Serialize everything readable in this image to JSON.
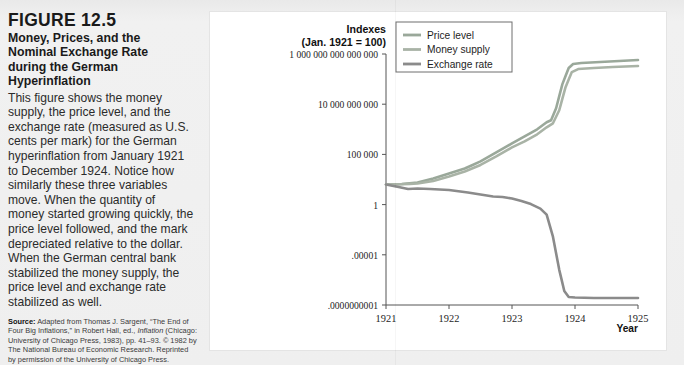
{
  "figure": {
    "number": "FIGURE 12.5",
    "title": "Money, Prices, and the Nominal Exchange Rate during the German Hyperinflation",
    "description": "This figure shows the money supply, the price level, and the exchange rate (measured as U.S. cents per mark) for the German hyperinflation from January 1921 to December 1924. Notice how similarly these three variables move. When the quantity of money started growing quickly, the price level followed, and the mark depreciated relative to the dollar. When the German central bank stabilized the money supply, the price level and exchange rate stabilized as well.",
    "source_label": "Source:",
    "source_text_1": "Adapted from Thomas J. Sargent, “The End of Four Big Inflations,” in Robert Hall, ed.,",
    "source_italic": "Inflation",
    "source_text_2": "(Chicago: University of Chicago Press, 1983), pp. 41–93. © 1982 by The National Bureau of Economic Research. Reprinted by permission of the University of Chicago Press."
  },
  "chart_data": {
    "type": "line",
    "title": "",
    "ylabel_line1": "Indexes",
    "ylabel_line2": "(Jan. 1921 = 100)",
    "xlabel": "Year",
    "ytick_labels": [
      "1 000 000 000 000 000",
      "10 000 000 000",
      "100 000",
      "1",
      ".00001",
      ".0000000001"
    ],
    "ytick_values": [
      1000000000000000.0,
      10000000000.0,
      100000.0,
      1,
      1e-05,
      1e-10
    ],
    "xtick_labels": [
      "1921",
      "1922",
      "1923",
      "1924",
      "1925"
    ],
    "xtick_values": [
      1921,
      1922,
      1923,
      1924,
      1925
    ],
    "xlim": [
      1921,
      1925
    ],
    "ylim_log10": [
      -10,
      15
    ],
    "grid": false,
    "legend_position": "top-right",
    "legend": [
      {
        "name": "Price level",
        "color": "#9aa89a"
      },
      {
        "name": "Money supply",
        "color": "#a9b3a6"
      },
      {
        "name": "Exchange rate",
        "color": "#8b8b8b"
      }
    ],
    "series": [
      {
        "name": "Price level",
        "color": "#9aa89a",
        "points": [
          [
            1921.0,
            2.0
          ],
          [
            1921.25,
            2.05
          ],
          [
            1921.5,
            2.2
          ],
          [
            1921.75,
            2.6
          ],
          [
            1922.0,
            3.1
          ],
          [
            1922.25,
            3.6
          ],
          [
            1922.5,
            4.3
          ],
          [
            1922.75,
            5.2
          ],
          [
            1923.0,
            6.1
          ],
          [
            1923.2,
            6.8
          ],
          [
            1923.4,
            7.5
          ],
          [
            1923.55,
            8.2
          ],
          [
            1923.62,
            8.4
          ],
          [
            1923.7,
            9.6
          ],
          [
            1923.8,
            12.0
          ],
          [
            1923.9,
            13.6
          ],
          [
            1923.97,
            14.0
          ],
          [
            1924.1,
            14.1
          ],
          [
            1924.4,
            14.2
          ],
          [
            1924.7,
            14.3
          ],
          [
            1925.0,
            14.4
          ]
        ]
      },
      {
        "name": "Money supply",
        "color": "#a9b3a6",
        "points": [
          [
            1921.0,
            2.0
          ],
          [
            1921.25,
            2.02
          ],
          [
            1921.5,
            2.1
          ],
          [
            1921.75,
            2.35
          ],
          [
            1922.0,
            2.8
          ],
          [
            1922.25,
            3.3
          ],
          [
            1922.5,
            3.95
          ],
          [
            1922.75,
            4.8
          ],
          [
            1923.0,
            5.7
          ],
          [
            1923.2,
            6.3
          ],
          [
            1923.4,
            7.0
          ],
          [
            1923.55,
            7.7
          ],
          [
            1923.65,
            8.1
          ],
          [
            1923.75,
            9.4
          ],
          [
            1923.85,
            11.7
          ],
          [
            1923.95,
            13.2
          ],
          [
            1924.05,
            13.5
          ],
          [
            1924.3,
            13.6
          ],
          [
            1924.6,
            13.7
          ],
          [
            1925.0,
            13.8
          ]
        ]
      },
      {
        "name": "Exchange rate",
        "color": "#8b8b8b",
        "points": [
          [
            1921.0,
            2.0
          ],
          [
            1921.2,
            1.75
          ],
          [
            1921.35,
            1.55
          ],
          [
            1921.5,
            1.6
          ],
          [
            1921.7,
            1.55
          ],
          [
            1922.0,
            1.45
          ],
          [
            1922.3,
            1.2
          ],
          [
            1922.55,
            0.95
          ],
          [
            1922.7,
            0.8
          ],
          [
            1922.85,
            0.75
          ],
          [
            1923.0,
            0.6
          ],
          [
            1923.15,
            0.35
          ],
          [
            1923.3,
            0.05
          ],
          [
            1923.45,
            -0.4
          ],
          [
            1923.55,
            -1.0
          ],
          [
            1923.65,
            -3.2
          ],
          [
            1923.75,
            -6.5
          ],
          [
            1923.83,
            -8.6
          ],
          [
            1923.9,
            -9.2
          ],
          [
            1924.0,
            -9.25
          ],
          [
            1924.3,
            -9.3
          ],
          [
            1924.7,
            -9.3
          ],
          [
            1925.0,
            -9.3
          ]
        ]
      }
    ]
  }
}
